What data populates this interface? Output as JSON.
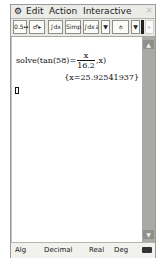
{
  "menubar": {
    "gear_icon": "⚙",
    "items": [
      "Edit",
      "Action",
      "Interactive"
    ],
    "close_icon": "✕"
  },
  "toolbar": {
    "buttons": [
      {
        "name": "decimal-fraction-toggle",
        "label": "0.5↔½"
      },
      {
        "name": "assist-arrow",
        "label": "♂▸"
      },
      {
        "name": "integrate-simplify",
        "label": "∫dx"
      },
      {
        "name": "simp",
        "label": "Simp"
      },
      {
        "name": "fdx",
        "label": "∫dx↓"
      },
      {
        "name": "dropdown-1",
        "label": "▼"
      },
      {
        "name": "graph-tool",
        "label": "⫛"
      },
      {
        "name": "dropdown-2",
        "label": "▼"
      },
      {
        "name": "scroll-right",
        "label": "▸"
      }
    ]
  },
  "work": {
    "input_prefix": "solve(tan(58)=",
    "frac_num": "x",
    "frac_den": "16.2",
    "input_suffix": ",x)",
    "result": "{x=25.92541937}"
  },
  "scrollbar": {
    "up": "▲",
    "down": "▼"
  },
  "status": {
    "mode": "Alg",
    "format": "Decimal",
    "number": "Real",
    "angle": "Deg"
  }
}
